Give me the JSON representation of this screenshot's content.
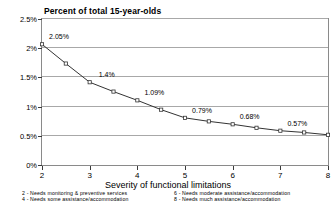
{
  "chart": {
    "title": "Percent of total 15-year-olds",
    "xlabel": "Severity of functional limitations"
  },
  "legend": {
    "left": [
      "2 - Needs monitoring & preventive services",
      "4 - Needs some assistance/accommodation"
    ],
    "right": [
      "6 - Needs moderate assistance/accommodation",
      "8 - Needs much assistance/accommodation"
    ]
  },
  "chart_data": {
    "type": "line",
    "title": "Percent of total 15-year-olds",
    "xlabel": "Severity of functional limitations",
    "ylabel": "",
    "xlim": [
      2,
      8
    ],
    "ylim": [
      0,
      2.5
    ],
    "xticks": [
      2,
      3,
      4,
      5,
      6,
      7,
      8
    ],
    "xticklabels": [
      "2",
      "3",
      "4",
      "5",
      "6",
      "7",
      "8"
    ],
    "yticks": [
      0,
      0.5,
      1,
      1.5,
      2,
      2.5
    ],
    "yticklabels": [
      "0%",
      "0.5%",
      "1%",
      "1.5%",
      "2%",
      "2.5%"
    ],
    "grid": "horizontal",
    "legend_position": "below-axis",
    "x": [
      2,
      2.5,
      3,
      3.5,
      4,
      4.5,
      5,
      5.5,
      6,
      6.5,
      7,
      7.5,
      8
    ],
    "values": [
      2.05,
      1.72,
      1.4,
      1.24,
      1.09,
      0.93,
      0.79,
      0.73,
      0.68,
      0.62,
      0.57,
      0.54,
      0.5
    ],
    "data_labels": [
      {
        "x": 2,
        "y": 2.05,
        "text": "2.05%"
      },
      {
        "x": 3,
        "y": 1.4,
        "text": "1.4%"
      },
      {
        "x": 4,
        "y": 1.09,
        "text": "1.09%"
      },
      {
        "x": 5,
        "y": 0.79,
        "text": "0.79%"
      },
      {
        "x": 6,
        "y": 0.68,
        "text": "0.68%"
      },
      {
        "x": 7,
        "y": 0.57,
        "text": "0.57%"
      }
    ],
    "series_color": "#333333",
    "marker": "square-open"
  }
}
